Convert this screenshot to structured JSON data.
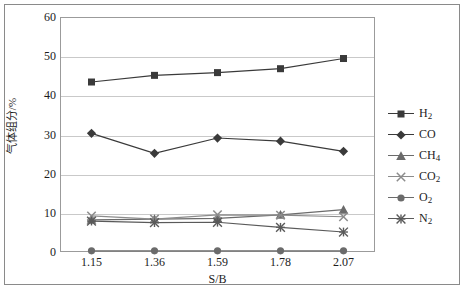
{
  "chart_data": {
    "type": "line",
    "title": "",
    "xlabel": "S/B",
    "ylabel": "气体组分/%",
    "categories": [
      "1.15",
      "1.36",
      "1.59",
      "1.78",
      "2.07"
    ],
    "x": [
      1.15,
      1.36,
      1.59,
      1.78,
      2.07
    ],
    "ylim": [
      0,
      60
    ],
    "yticks": [
      0,
      10,
      20,
      30,
      40,
      50,
      60
    ],
    "ytick_labels": [
      "0",
      "10",
      "20",
      "30",
      "40",
      "50",
      "60"
    ],
    "grid": true,
    "legend_position": "right",
    "series": [
      {
        "name": "H2",
        "label": "H",
        "sub": "2",
        "marker": "square",
        "color": "#3a3a3a",
        "values": [
          43.4,
          45.1,
          45.8,
          46.8,
          49.4
        ]
      },
      {
        "name": "CO",
        "label": "CO",
        "sub": "",
        "marker": "diamond",
        "color": "#3a3a3a",
        "values": [
          30.3,
          25.2,
          29.1,
          28.3,
          25.7
        ]
      },
      {
        "name": "CH4",
        "label": "CH",
        "sub": "4",
        "marker": "triangle",
        "color": "#6b6b6b",
        "values": [
          8.2,
          8.4,
          8.6,
          9.5,
          10.8
        ]
      },
      {
        "name": "CO2",
        "label": "CO",
        "sub": "2",
        "marker": "cross",
        "color": "#8c8c8c",
        "values": [
          9.2,
          8.4,
          9.5,
          9.4,
          9.0
        ]
      },
      {
        "name": "O2",
        "label": "O",
        "sub": "2",
        "marker": "circle",
        "color": "#6b6b6b",
        "values": [
          0.3,
          0.3,
          0.3,
          0.3,
          0.3
        ]
      },
      {
        "name": "N2",
        "label": "N",
        "sub": "2",
        "marker": "star",
        "color": "#5a5a5a",
        "values": [
          7.9,
          7.5,
          7.6,
          6.3,
          5.1
        ]
      }
    ]
  }
}
